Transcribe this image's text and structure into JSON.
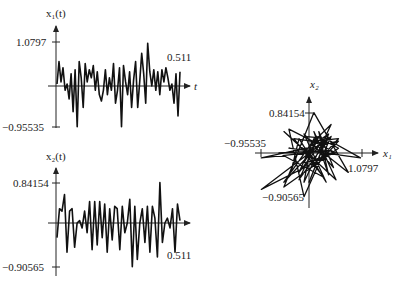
{
  "chart_data": [
    {
      "type": "line",
      "title": "x1(t) time series",
      "ylabel": "x1(t)",
      "xlabel": "t",
      "ytick_labels": [
        "1.0797",
        "-0.95535"
      ],
      "ylim": [
        -0.95535,
        1.0797
      ],
      "annotations": [
        "0.511"
      ],
      "x_end": 0.511,
      "values": [
        0.05,
        0.6,
        0.1,
        0.45,
        -0.1,
        0.05,
        -0.3,
        0.3,
        -0.6,
        0.4,
        -0.95,
        0.6,
        0.2,
        -0.5,
        0.55,
        0.1,
        0.4,
        0.2,
        0.5,
        -0.1,
        0.35,
        -0.2,
        -0.35,
        -0.1,
        0.4,
        -0.2,
        0.2,
        -0.1,
        0.55,
        -0.4,
        -0.1,
        0.45,
        -0.95,
        0.5,
        0.1,
        -0.2,
        0.35,
        -0.5,
        0.15,
        0.6,
        -0.5,
        0.1,
        0.8,
        0.3,
        -0.4,
        1.05,
        0.35,
        0.0,
        0.4,
        -0.1,
        0.35,
        -0.2,
        0.4,
        0.1,
        0.45,
        0.2,
        -0.1,
        0.05,
        -0.4,
        0.3,
        -0.7,
        0.35
      ]
    },
    {
      "type": "line",
      "title": "x2(t) time series",
      "ylabel": "x2(t)",
      "xlabel": "t",
      "ytick_labels": [
        "0.84154",
        "-0.90565"
      ],
      "ylim": [
        -0.90565,
        0.84154
      ],
      "annotations": [
        "0.511"
      ],
      "x_end": 0.511,
      "values": [
        -0.3,
        0.3,
        0.25,
        0.6,
        -0.6,
        0.25,
        0.3,
        -0.5,
        0.0,
        0.05,
        -0.1,
        0.25,
        -0.2,
        0.45,
        -0.55,
        0.45,
        -0.45,
        0.45,
        -0.3,
        0.4,
        -0.6,
        0.3,
        -0.35,
        0.35,
        0.3,
        -0.55,
        0.35,
        -0.2,
        0.0,
        0.5,
        -0.9,
        0.35,
        -0.75,
        0.0,
        0.3,
        -0.4,
        0.35,
        -0.6,
        0.35,
        0.1,
        -0.7,
        0.85,
        -0.4,
        0.0,
        0.1,
        -0.1,
        0.3,
        -0.6,
        0.4,
        0.05
      ]
    },
    {
      "type": "scatter",
      "title": "Phase portrait x2 vs x1",
      "xlabel": "x1",
      "ylabel": "x2",
      "x_tick_labels": [
        "-0.95535",
        "1.0797"
      ],
      "y_tick_labels": [
        "0.84154",
        "-0.90565"
      ],
      "xlim": [
        -0.95535,
        1.0797
      ],
      "ylim": [
        -0.90565,
        0.84154
      ]
    }
  ],
  "plot1": {
    "ylabel": "x₁(t)",
    "ymax": "1.0797",
    "ymin": "−0.95535",
    "xlabel": "t",
    "end": "0.511"
  },
  "plot2": {
    "ylabel": "x₂(t)",
    "ymax": "0.84154",
    "ymin": "−0.90565",
    "xlabel": "t",
    "end": "0.511"
  },
  "phase": {
    "xlabel": "x₁",
    "ylabel": "x₂",
    "ymax": "0.84154",
    "ymin": "−0.90565",
    "xmin": "−0.95535",
    "xmax": "1.0797"
  }
}
